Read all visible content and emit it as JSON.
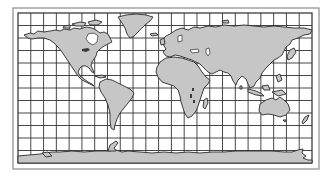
{
  "figure": {
    "projection": "equirectangular (cylindrical)",
    "grid": {
      "columns": 23,
      "rows": 12
    },
    "colors": {
      "background": "#ffffff",
      "land": "#c6c6c6",
      "outline": "#2a2a2a",
      "grid": "#333333",
      "outer_frame": "#8a8a8a"
    },
    "landmasses": [
      "North America",
      "Greenland",
      "South America",
      "Europe",
      "Asia",
      "Africa",
      "Madagascar",
      "Australia",
      "New Zealand",
      "Antarctica",
      "Japan",
      "Indonesia",
      "British Isles"
    ]
  }
}
